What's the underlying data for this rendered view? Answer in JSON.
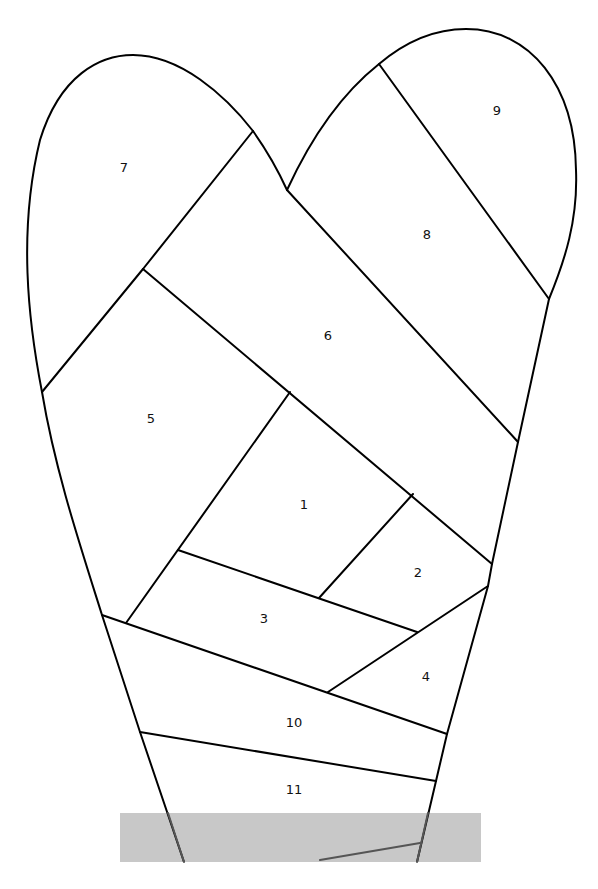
{
  "diagram": {
    "type": "crazy-quilt stocking / heart-shaped foundation pattern",
    "colors": {
      "line": "#000000",
      "background": "#ffffff",
      "band": "#c8c8c8"
    },
    "sections": [
      {
        "id": "1",
        "label": "1",
        "x": 304,
        "y": 505
      },
      {
        "id": "2",
        "label": "2",
        "x": 418,
        "y": 573
      },
      {
        "id": "3",
        "label": "3",
        "x": 264,
        "y": 619
      },
      {
        "id": "4",
        "label": "4",
        "x": 426,
        "y": 677
      },
      {
        "id": "5",
        "label": "5",
        "x": 151,
        "y": 419
      },
      {
        "id": "6",
        "label": "6",
        "x": 328,
        "y": 336
      },
      {
        "id": "7",
        "label": "7",
        "x": 124,
        "y": 168
      },
      {
        "id": "8",
        "label": "8",
        "x": 427,
        "y": 235
      },
      {
        "id": "9",
        "label": "9",
        "x": 497,
        "y": 111
      },
      {
        "id": "10",
        "label": "10",
        "x": 294,
        "y": 723
      },
      {
        "id": "11",
        "label": "11",
        "x": 294,
        "y": 790
      }
    ]
  }
}
